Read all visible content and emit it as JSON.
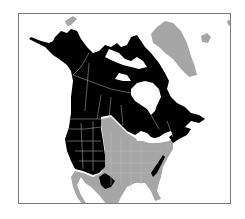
{
  "map": {
    "title": "North America range map",
    "region": "North America",
    "colors": {
      "background": "#ffffff",
      "frame": "#7a7a7a",
      "range": "#000000",
      "non_range_land": "#a6a6a6",
      "borders": "#bdbdbd",
      "water": "#ffffff"
    },
    "legend": {
      "range_label": "Species range",
      "outside_label": "Outside range"
    },
    "areas": [
      {
        "name": "Alaska",
        "status": "range"
      },
      {
        "name": "Western Canada",
        "status": "range"
      },
      {
        "name": "Northern Canada",
        "status": "range"
      },
      {
        "name": "Eastern Canada",
        "status": "range"
      },
      {
        "name": "Western United States",
        "status": "range"
      },
      {
        "name": "Northern Mexico (Sierra Madre)",
        "status": "range"
      },
      {
        "name": "Appalachians",
        "status": "range"
      },
      {
        "name": "Central & Eastern United States",
        "status": "outside"
      },
      {
        "name": "Greenland",
        "status": "outside"
      },
      {
        "name": "Mexico (Baja & mainland)",
        "status": "outside"
      },
      {
        "name": "Hudson Bay",
        "status": "water"
      }
    ]
  }
}
